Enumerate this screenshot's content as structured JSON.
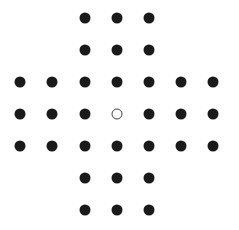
{
  "game": {
    "name": "Peg Solitaire",
    "board_shape": "english-cross",
    "grid_size": 7,
    "col_x": [
      20,
      52,
      85,
      117,
      149,
      181,
      213
    ],
    "row_y": [
      18,
      50,
      82,
      114,
      146,
      178,
      210
    ],
    "colors": {
      "peg": "#1a1a1a",
      "empty_border": "#444444",
      "background": "#ffffff"
    },
    "board": [
      [
        null,
        null,
        1,
        1,
        1,
        null,
        null
      ],
      [
        null,
        null,
        1,
        1,
        1,
        null,
        null
      ],
      [
        1,
        1,
        1,
        1,
        1,
        1,
        1
      ],
      [
        1,
        1,
        1,
        0,
        1,
        1,
        1
      ],
      [
        1,
        1,
        1,
        1,
        1,
        1,
        1
      ],
      [
        null,
        null,
        1,
        1,
        1,
        null,
        null
      ],
      [
        null,
        null,
        1,
        1,
        1,
        null,
        null
      ]
    ],
    "peg_count": 32,
    "empty_count": 1
  }
}
